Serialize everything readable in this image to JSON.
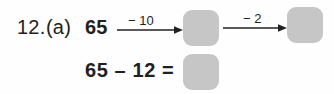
{
  "worksheet": {
    "question_number": "12.",
    "part_label": "(a)",
    "box_fill_color": "#c6c6c6",
    "text_color": "#231f20",
    "background_color": "#fefefe"
  },
  "number_chain": {
    "start_number": "65",
    "steps": [
      {
        "operator_label": "− 10",
        "arrow": "right-arrow",
        "result_box_value": ""
      },
      {
        "operator_label": "− 2",
        "arrow": "right-arrow",
        "result_box_value": ""
      }
    ]
  },
  "equation_row": {
    "expression": "65 – 12 =",
    "answer_box_value": ""
  }
}
